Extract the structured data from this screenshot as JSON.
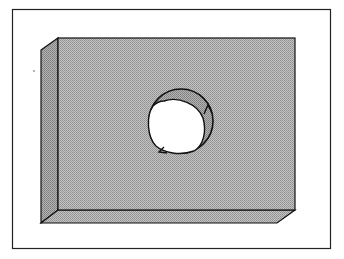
{
  "figure": {
    "colors": {
      "background": "#ffffff",
      "frame_stroke": "#222222",
      "face_fill": "#b5b5b5",
      "side_fill": "#a6a6a6",
      "hole_fill": "#ffffff",
      "hole_inner_wall": "#9a9a9a",
      "line": "#111111"
    },
    "elements": [
      {
        "name": "outer-frame"
      },
      {
        "name": "slab-front-face"
      },
      {
        "name": "slab-left-face"
      },
      {
        "name": "slab-bottom-face"
      },
      {
        "name": "hole"
      },
      {
        "name": "circulation-arrow-up"
      },
      {
        "name": "circulation-arrow-left"
      }
    ]
  }
}
